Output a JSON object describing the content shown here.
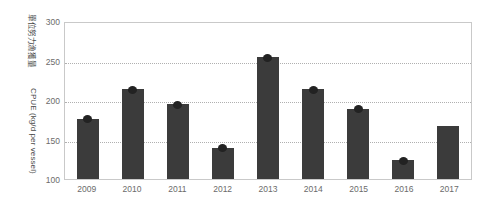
{
  "chart_data": {
    "type": "bar",
    "title": "",
    "xlabel": "",
    "ylabel_cjk": "單位努力漁獲量",
    "ylabel": "CPUE (kg/d per vessel)",
    "categories": [
      "2009",
      "2010",
      "2011",
      "2012",
      "2013",
      "2014",
      "2015",
      "2016",
      "2017"
    ],
    "values": [
      177,
      215,
      196,
      140,
      256,
      215,
      190,
      124,
      168
    ],
    "point_markers": [
      177,
      215,
      196,
      140,
      256,
      215,
      190,
      124,
      null
    ],
    "ylim": [
      100,
      300
    ],
    "yticks": [
      300,
      250,
      200,
      150,
      100
    ],
    "ytick_labels": [
      "300",
      "250",
      "200",
      "150",
      "100"
    ],
    "grid": true,
    "grid_style": "dotted-horizontal",
    "legend": null,
    "series": [
      {
        "name": "CPUE",
        "values": [
          177,
          215,
          196,
          140,
          256,
          215,
          190,
          124,
          168
        ]
      }
    ],
    "colors": {
      "bar": "#3b3b3b",
      "marker": "#222222",
      "grid": "#b0b0b0",
      "frame": "#c9c9c9",
      "text": "#6b6b6b",
      "background": "#ffffff"
    }
  }
}
